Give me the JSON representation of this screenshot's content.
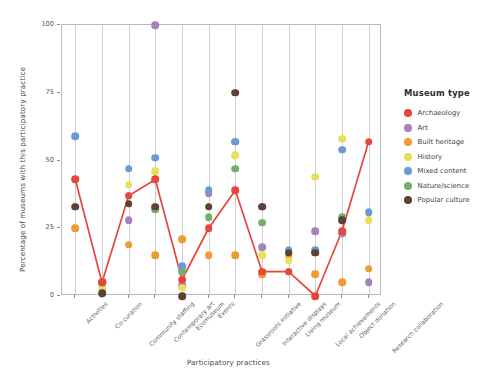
{
  "chart_data": {
    "type": "scatter",
    "title": "",
    "xlabel": "Participatory practices",
    "ylabel": "Percentage of museums with this participatory practice",
    "ylim": [
      0,
      100
    ],
    "yticks": [
      0,
      25,
      50,
      75,
      100
    ],
    "grid": "vertical",
    "legend_position": "right",
    "legend_title": "Museum type",
    "categories": [
      "Activities",
      "Co-curation",
      "Community staffing",
      "Contemporary art",
      "Ecomuseum",
      "Events",
      "Grassroots initiative",
      "Interactive displays",
      "Living museum",
      "Local achievements",
      "Object donation",
      "Research collaboration"
    ],
    "series": [
      {
        "name": "Archaeology",
        "color": "#e8453c",
        "values": [
          43,
          5,
          37,
          43,
          6,
          25,
          39,
          9,
          9,
          0,
          24,
          57
        ],
        "connected": true
      },
      {
        "name": "Art",
        "color": "#a383b8",
        "values": [
          null,
          5,
          28,
          100,
          4,
          38,
          57,
          18,
          9,
          24,
          23,
          5
        ],
        "connected": false
      },
      {
        "name": "Built heritage",
        "color": "#ef9a33",
        "values": [
          25,
          5,
          19,
          15,
          21,
          15,
          15,
          8,
          15,
          8,
          5,
          10
        ],
        "connected": false
      },
      {
        "name": "History",
        "color": "#e8e05a",
        "values": [
          null,
          3,
          41,
          46,
          3,
          33,
          52,
          15,
          13,
          44,
          58,
          28
        ],
        "connected": false
      },
      {
        "name": "Mixed content",
        "color": "#6b9bd2",
        "values": [
          59,
          5,
          47,
          51,
          11,
          39,
          57,
          33,
          17,
          17,
          54,
          31
        ],
        "connected": false
      },
      {
        "name": "Nature/science",
        "color": "#74b06a",
        "values": [
          null,
          5,
          37,
          32,
          9,
          29,
          47,
          27,
          16,
          16,
          29,
          null
        ],
        "connected": false
      },
      {
        "name": "Popular culture",
        "color": "#5d4037",
        "values": [
          33,
          1,
          34,
          33,
          0,
          33,
          75,
          33,
          16,
          16,
          28,
          null
        ],
        "connected": false
      }
    ]
  },
  "legend": {
    "title": "Museum type",
    "items": [
      {
        "label": "Archaeology",
        "color": "#e8453c"
      },
      {
        "label": "Art",
        "color": "#a383b8"
      },
      {
        "label": "Built heritage",
        "color": "#ef9a33"
      },
      {
        "label": "History",
        "color": "#e8e05a"
      },
      {
        "label": "Mixed content",
        "color": "#6b9bd2"
      },
      {
        "label": "Nature/science",
        "color": "#74b06a"
      },
      {
        "label": "Popular culture",
        "color": "#5d4037"
      }
    ]
  },
  "axes": {
    "x_title": "Participatory practices",
    "y_title": "Percentage of museums with this participatory practice"
  }
}
